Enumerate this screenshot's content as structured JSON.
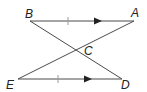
{
  "diagram": {
    "type": "geometry",
    "colors": {
      "stroke": "#4a4a4a",
      "label": "#222222",
      "background": "#ffffff"
    },
    "points": {
      "B": {
        "label": "B",
        "x": 30,
        "y": 21
      },
      "A": {
        "label": "A",
        "x": 134,
        "y": 21
      },
      "C": {
        "label": "C",
        "x": 76,
        "y": 50
      },
      "E": {
        "label": "E",
        "x": 18,
        "y": 79
      },
      "D": {
        "label": "D",
        "x": 122,
        "y": 79
      }
    },
    "segments": [
      {
        "from": "B",
        "to": "A",
        "marks": [
          "tick",
          "arrow"
        ]
      },
      {
        "from": "E",
        "to": "D",
        "marks": [
          "tick",
          "arrow"
        ]
      },
      {
        "from": "B",
        "to": "D",
        "marks": []
      },
      {
        "from": "E",
        "to": "A",
        "marks": []
      }
    ],
    "relations": [
      "BA ∥ ED",
      "BA ≅ ED"
    ]
  }
}
